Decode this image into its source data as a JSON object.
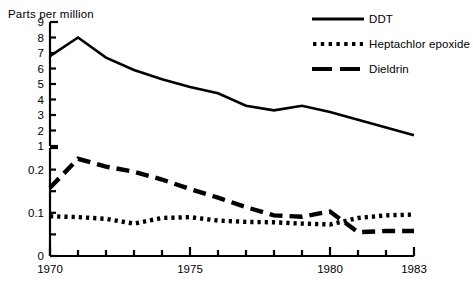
{
  "chart_data": {
    "type": "line",
    "title": "",
    "ylabel": "Parts per million",
    "xlabel": "",
    "grid": false,
    "legend_position": "top-right",
    "panels": [
      {
        "name": "upper-panel",
        "ylim": [
          1,
          9
        ],
        "yticks": [
          1,
          2,
          3,
          4,
          5,
          6,
          7,
          8,
          9
        ],
        "ytick_labels": [
          "1",
          "2",
          "3",
          "4",
          "5",
          "6",
          "7",
          "8",
          "9"
        ],
        "series_names": [
          "DDT"
        ]
      },
      {
        "name": "lower-panel",
        "ylim": [
          0,
          0.25
        ],
        "yticks": [
          0,
          0.05,
          0.1,
          0.15,
          0.2,
          0.25
        ],
        "ytick_labels": [
          "0",
          "",
          "0.1",
          "",
          "0.2",
          ""
        ],
        "series_names": [
          "Heptachlor epoxide",
          "Dieldrin"
        ]
      }
    ],
    "x": [
      1970,
      1971,
      1972,
      1973,
      1974,
      1975,
      1976,
      1977,
      1978,
      1979,
      1980,
      1981,
      1982,
      1983
    ],
    "xlim": [
      1970,
      1983
    ],
    "xticks": [
      1970,
      1971,
      1972,
      1973,
      1974,
      1975,
      1976,
      1977,
      1978,
      1979,
      1980,
      1981,
      1982,
      1983
    ],
    "xtick_labels": [
      "1970",
      "",
      "",
      "",
      "",
      "1975",
      "",
      "",
      "",
      "",
      "1980",
      "",
      "",
      "1983"
    ],
    "series": [
      {
        "name": "DDT",
        "panel": "upper-panel",
        "style": "solid",
        "values": [
          6.8,
          8.0,
          6.7,
          5.9,
          5.3,
          4.8,
          4.4,
          3.6,
          3.3,
          3.6,
          3.2,
          2.7,
          2.2,
          1.7
        ]
      },
      {
        "name": "Heptachlor epoxide",
        "panel": "lower-panel",
        "style": "dotted",
        "values": [
          0.092,
          0.09,
          0.086,
          0.075,
          0.088,
          0.09,
          0.082,
          0.079,
          0.078,
          0.075,
          0.073,
          0.088,
          0.094,
          0.096
        ]
      },
      {
        "name": "Dieldrin",
        "panel": "lower-panel",
        "style": "dashed",
        "values": [
          0.158,
          0.225,
          0.207,
          0.195,
          0.177,
          0.155,
          0.135,
          0.113,
          0.094,
          0.091,
          0.103,
          0.055,
          0.058,
          0.058
        ]
      }
    ]
  },
  "legend": {
    "items": [
      {
        "label": "DDT",
        "style": "solid"
      },
      {
        "label": "Heptachlor epoxide",
        "style": "dotted"
      },
      {
        "label": "Dieldrin",
        "style": "dashed"
      }
    ]
  },
  "colors": {
    "ink": "#000000",
    "background": "#ffffff"
  }
}
